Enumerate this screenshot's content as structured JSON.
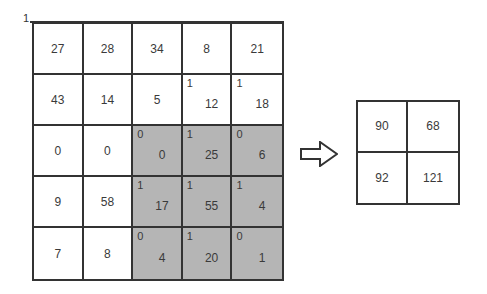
{
  "corner_label": "1",
  "input_grid": {
    "rows": [
      [
        {
          "value": "27",
          "sup": null,
          "shaded": false
        },
        {
          "value": "28",
          "sup": null,
          "shaded": false
        },
        {
          "value": "34",
          "sup": null,
          "shaded": false
        },
        {
          "value": "8",
          "sup": null,
          "shaded": false
        },
        {
          "value": "21",
          "sup": null,
          "shaded": false
        }
      ],
      [
        {
          "value": "43",
          "sup": null,
          "shaded": false
        },
        {
          "value": "14",
          "sup": null,
          "shaded": false
        },
        {
          "value": "5",
          "sup": null,
          "shaded": false
        },
        {
          "value": "12",
          "sup": "1",
          "shaded": false
        },
        {
          "value": "18",
          "sup": "1",
          "shaded": false
        }
      ],
      [
        {
          "value": "0",
          "sup": null,
          "shaded": false
        },
        {
          "value": "0",
          "sup": null,
          "shaded": false
        },
        {
          "value": "0",
          "sup": "0",
          "shaded": true
        },
        {
          "value": "25",
          "sup": "1",
          "shaded": true
        },
        {
          "value": "6",
          "sup": "0",
          "shaded": true
        }
      ],
      [
        {
          "value": "9",
          "sup": null,
          "shaded": false
        },
        {
          "value": "58",
          "sup": null,
          "shaded": false
        },
        {
          "value": "17",
          "sup": "1",
          "shaded": true
        },
        {
          "value": "55",
          "sup": "1",
          "shaded": true
        },
        {
          "value": "4",
          "sup": "1",
          "shaded": true
        }
      ],
      [
        {
          "value": "7",
          "sup": null,
          "shaded": false
        },
        {
          "value": "8",
          "sup": null,
          "shaded": false
        },
        {
          "value": "4",
          "sup": "0",
          "shaded": true
        },
        {
          "value": "20",
          "sup": "1",
          "shaded": true
        },
        {
          "value": "1",
          "sup": "0",
          "shaded": true
        }
      ]
    ],
    "shade_color": "#b5b5b5",
    "line_color": "#333333"
  },
  "arrow": {
    "direction": "right",
    "style": "outline"
  },
  "output_grid": {
    "rows": [
      [
        "90",
        "68"
      ],
      [
        "92",
        "121"
      ]
    ]
  }
}
